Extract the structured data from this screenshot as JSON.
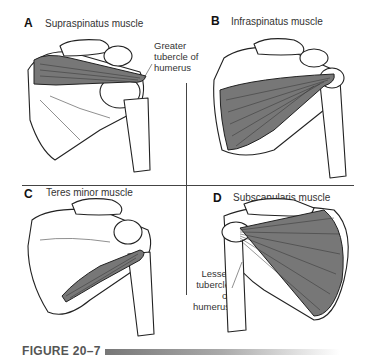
{
  "figure": {
    "caption": "FIGURE 20–7",
    "bar_gradient": [
      "#777777",
      "#aaaaaa",
      "#ffffff"
    ]
  },
  "panels": [
    {
      "letter": "A",
      "title": "Supraspinatus muscle",
      "callout": [
        "Greater",
        "tubercle of",
        "humerus"
      ]
    },
    {
      "letter": "B",
      "title": "Infraspinatus muscle"
    },
    {
      "letter": "C",
      "title": "Teres minor muscle"
    },
    {
      "letter": "D",
      "title": "Subscapularis muscle",
      "callout": [
        "Lesser",
        "tubercle",
        "of",
        "humerus"
      ]
    }
  ]
}
